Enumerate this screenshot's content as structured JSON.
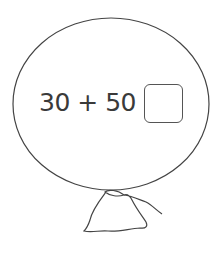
{
  "problem": {
    "expression": "30 + 50 =",
    "answer": ""
  },
  "colors": {
    "stroke": "#444444",
    "text": "#3a3a3a",
    "background": "#ffffff"
  }
}
